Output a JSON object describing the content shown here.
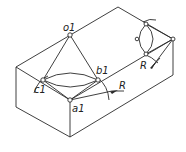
{
  "labels": {
    "o1": "o1",
    "b1": "b1",
    "c1": "c1",
    "a1": "a1",
    "R_front": "R",
    "R_right": "R"
  },
  "colors": {
    "line": "#2a2a2a",
    "background": "#ffffff"
  }
}
